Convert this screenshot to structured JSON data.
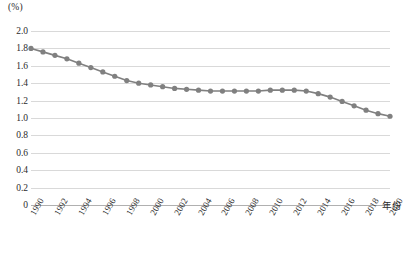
{
  "chart_data": {
    "type": "line",
    "title": "",
    "subtitle": "",
    "xlabel": "年份",
    "ylabel": "(%)",
    "unit_label": "(%)",
    "grid": true,
    "legend": false,
    "legend_position": "none",
    "line_color": "#808080",
    "marker_color": "#808080",
    "marker_shape": "circle",
    "xlim": [
      1990,
      2020
    ],
    "ylim": [
      0,
      2.0
    ],
    "yticks": [
      "0",
      "0.2",
      "0.4",
      "0.6",
      "0.8",
      "1.0",
      "1.2",
      "1.4",
      "1.6",
      "1.8",
      "2.0"
    ],
    "ytick_values": [
      0,
      0.2,
      0.4,
      0.6,
      0.8,
      1.0,
      1.2,
      1.4,
      1.6,
      1.8,
      2.0
    ],
    "xticks": [
      "1990",
      "1992",
      "1994",
      "1996",
      "1998",
      "2000",
      "2002",
      "2004",
      "2006",
      "2008",
      "2010",
      "2012",
      "2014",
      "2016",
      "2018",
      "2020"
    ],
    "xtick_values": [
      1990,
      1992,
      1994,
      1996,
      1998,
      2000,
      2002,
      2004,
      2006,
      2008,
      2010,
      2012,
      2014,
      2016,
      2018,
      2020
    ],
    "x": [
      1990,
      1991,
      1992,
      1993,
      1994,
      1995,
      1996,
      1997,
      1998,
      1999,
      2000,
      2001,
      2002,
      2003,
      2004,
      2005,
      2006,
      2007,
      2008,
      2009,
      2010,
      2011,
      2012,
      2013,
      2014,
      2015,
      2016,
      2017,
      2018,
      2019,
      2020
    ],
    "values": [
      1.8,
      1.76,
      1.72,
      1.68,
      1.63,
      1.58,
      1.53,
      1.48,
      1.43,
      1.4,
      1.38,
      1.36,
      1.34,
      1.33,
      1.32,
      1.31,
      1.31,
      1.31,
      1.31,
      1.31,
      1.32,
      1.32,
      1.32,
      1.31,
      1.28,
      1.24,
      1.19,
      1.14,
      1.09,
      1.05,
      1.02
    ],
    "series": [
      {
        "name": "",
        "values": [
          1.8,
          1.76,
          1.72,
          1.68,
          1.63,
          1.58,
          1.53,
          1.48,
          1.43,
          1.4,
          1.38,
          1.36,
          1.34,
          1.33,
          1.32,
          1.31,
          1.31,
          1.31,
          1.31,
          1.31,
          1.32,
          1.32,
          1.32,
          1.31,
          1.28,
          1.24,
          1.19,
          1.14,
          1.09,
          1.05,
          1.02
        ]
      }
    ]
  }
}
